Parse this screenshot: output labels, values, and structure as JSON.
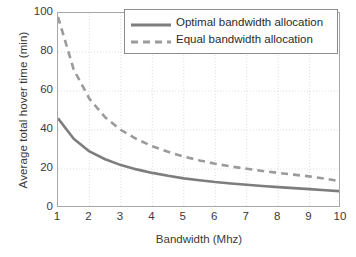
{
  "chart_data": {
    "type": "line",
    "title": "",
    "xlabel": "Bandwidth (Mhz)",
    "ylabel": "Average total hover time (min)",
    "xlim": [
      1,
      10
    ],
    "ylim": [
      0,
      100
    ],
    "xticks": [
      "1",
      "2",
      "3",
      "4",
      "5",
      "6",
      "7",
      "8",
      "9",
      "10"
    ],
    "yticks": [
      "0",
      "20",
      "40",
      "60",
      "80",
      "100"
    ],
    "grid": true,
    "legend_position": "top-right-inside",
    "x": [
      1,
      1.5,
      2,
      2.5,
      3,
      3.5,
      4,
      4.5,
      5,
      5.5,
      6,
      6.5,
      7,
      7.5,
      8,
      8.5,
      9,
      9.5,
      10
    ],
    "series": [
      {
        "name": "Optimal bandwidth allocation",
        "style": "solid",
        "color": "#7d7d7d",
        "values": [
          46.0,
          35.5,
          29.0,
          25.0,
          22.0,
          19.8,
          18.0,
          16.5,
          15.2,
          14.2,
          13.3,
          12.6,
          11.9,
          11.3,
          10.7,
          10.2,
          9.7,
          9.1,
          8.6
        ]
      },
      {
        "name": "Equal bandwidth allocation",
        "style": "dashed",
        "color": "#9b9b9b",
        "values": [
          98.0,
          71.0,
          56.0,
          46.5,
          40.0,
          35.3,
          31.7,
          28.8,
          26.4,
          24.4,
          22.7,
          21.3,
          20.1,
          19.0,
          18.0,
          17.1,
          16.2,
          15.0,
          13.6
        ]
      }
    ]
  },
  "legend": {
    "items": [
      {
        "label": "Optimal bandwidth allocation",
        "style": "solid"
      },
      {
        "label": "Equal bandwidth allocation",
        "style": "dashed"
      }
    ]
  },
  "colors": {
    "solid_line": "#7d7d7d",
    "dashed_line": "#9b9b9b",
    "axis": "#a8a8a8",
    "grid": "#dedede",
    "text": "#3a3a3a",
    "background": "#ffffff"
  }
}
